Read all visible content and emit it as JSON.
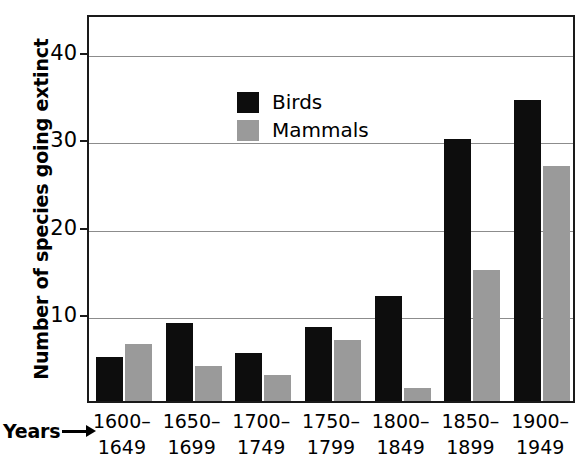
{
  "chart_data": {
    "type": "bar",
    "title": "",
    "xlabel": "Years",
    "ylabel": "Number of species going extinct",
    "categories": [
      "1600–1649",
      "1650–1699",
      "1700–1749",
      "1750–1799",
      "1800–1849",
      "1850–1899",
      "1900–1949"
    ],
    "category_lines": [
      {
        "line1": "1600–",
        "line2": "1649"
      },
      {
        "line1": "1650–",
        "line2": "1699"
      },
      {
        "line1": "1700–",
        "line2": "1749"
      },
      {
        "line1": "1750–",
        "line2": "1799"
      },
      {
        "line1": "1800–",
        "line2": "1849"
      },
      {
        "line1": "1850–",
        "line2": "1899"
      },
      {
        "line1": "1900–",
        "line2": "1949"
      }
    ],
    "series": [
      {
        "name": "Birds",
        "color": "#0d0d0d",
        "values": [
          5,
          9,
          5.5,
          8.5,
          12,
          30,
          34.5
        ]
      },
      {
        "name": "Mammals",
        "color": "#9a9a9a",
        "values": [
          6.5,
          4,
          3,
          7,
          1.5,
          15,
          27
        ]
      }
    ],
    "ylim": [
      0,
      44.5
    ],
    "yticks": [
      10,
      20,
      30,
      40
    ],
    "ytick_labels": [
      "10",
      "20",
      "30",
      "40"
    ],
    "grid": true,
    "legend_position": "upper-left-inside",
    "legend_entries": [
      {
        "label": "Birds",
        "color": "#0d0d0d"
      },
      {
        "label": "Mammals",
        "color": "#9a9a9a"
      }
    ]
  },
  "axes": {
    "y_title": "Number of species going extinct",
    "x_title": "Years"
  }
}
